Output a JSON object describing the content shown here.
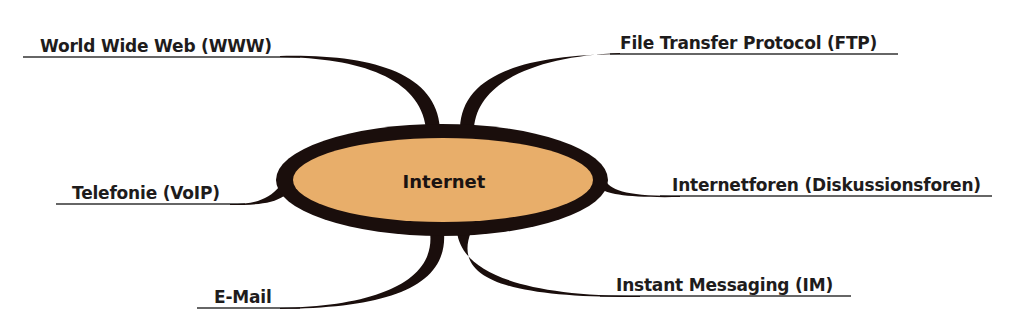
{
  "diagram": {
    "type": "mind-map",
    "center": {
      "label": "Internet",
      "fill_color": "#E8AE6A",
      "border_color": "#1A0E0C"
    },
    "branches": [
      {
        "id": "www",
        "label": "World Wide Web (WWW)",
        "side": "left",
        "position": "top"
      },
      {
        "id": "ftp",
        "label": "File Transfer Protocol (FTP)",
        "side": "right",
        "position": "top"
      },
      {
        "id": "voip",
        "label": "Telefonie (VoIP)",
        "side": "left",
        "position": "middle"
      },
      {
        "id": "foren",
        "label": "Internetforen (Diskussionsforen)",
        "side": "right",
        "position": "middle"
      },
      {
        "id": "email",
        "label": "E-Mail",
        "side": "left",
        "position": "bottom"
      },
      {
        "id": "im",
        "label": "Instant Messaging (IM)",
        "side": "right",
        "position": "bottom"
      }
    ],
    "colors": {
      "branch_stroke": "#1A0E0C",
      "underline": "#333333",
      "text": "#1E1C1C",
      "background": "#FFFFFF"
    }
  }
}
